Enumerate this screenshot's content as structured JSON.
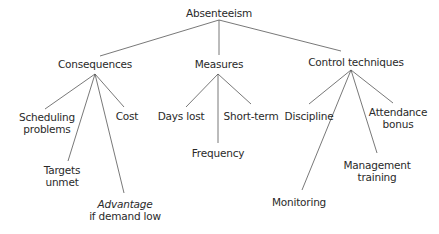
{
  "diagram": {
    "root": {
      "label": "Absenteeism"
    },
    "branches": [
      {
        "label": "Consequences",
        "children": [
          {
            "lines": [
              "Scheduling",
              "problems"
            ]
          },
          {
            "lines": [
              "Targets",
              "unmet"
            ]
          },
          {
            "lines": [
              "Advantage",
              "if demand low"
            ],
            "italic_first_line": true
          },
          {
            "lines": [
              "Cost"
            ]
          }
        ]
      },
      {
        "label": "Measures",
        "children": [
          {
            "lines": [
              "Days lost"
            ]
          },
          {
            "lines": [
              "Frequency"
            ]
          },
          {
            "lines": [
              "Short-term"
            ]
          }
        ]
      },
      {
        "label": "Control techniques",
        "children": [
          {
            "lines": [
              "Discipline"
            ]
          },
          {
            "lines": [
              "Monitoring"
            ]
          },
          {
            "lines": [
              "Management",
              "training"
            ]
          },
          {
            "lines": [
              "Attendance",
              "bonus"
            ]
          }
        ]
      }
    ]
  },
  "colors": {
    "line": "#555555",
    "text": "#2a2a2a"
  }
}
